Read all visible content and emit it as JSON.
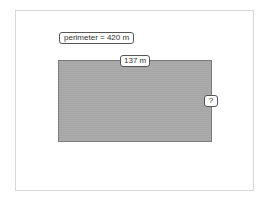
{
  "diagram": {
    "perimeter_label": "perimeter = 420 m",
    "top_side_label": "137 m",
    "right_side_label": "?",
    "shape": "rectangle",
    "colors": {
      "rectangle_fill": "#a6a6a6",
      "rectangle_border": "#7a7a7a",
      "label_border": "#555555",
      "frame_border": "#d8d8d8"
    }
  }
}
